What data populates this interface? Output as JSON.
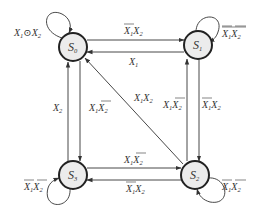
{
  "diagram": {
    "type": "state-transition",
    "states": [
      {
        "id": "S0",
        "name": "S",
        "sub": "0",
        "cx": 73,
        "cy": 47
      },
      {
        "id": "S1",
        "name": "S",
        "sub": "1",
        "cx": 198,
        "cy": 45
      },
      {
        "id": "S3",
        "name": "S",
        "sub": "3",
        "cx": 73,
        "cy": 175
      },
      {
        "id": "S2",
        "name": "S",
        "sub": "2",
        "cx": 195,
        "cy": 175
      }
    ],
    "transitions": [
      {
        "from": "S0",
        "to": "S0",
        "label": "X1⊙X2"
      },
      {
        "from": "S1",
        "to": "S1",
        "label": "X̄1X̄2"
      },
      {
        "from": "S3",
        "to": "S3",
        "label": "X̄1X̄2"
      },
      {
        "from": "S2",
        "to": "S2",
        "label": "X̄1X̄2"
      },
      {
        "from": "S0",
        "to": "S1",
        "label": "X̄1X2"
      },
      {
        "from": "S1",
        "to": "S0",
        "label": "X1"
      },
      {
        "from": "S3",
        "to": "S0",
        "label": "X2"
      },
      {
        "from": "S0",
        "to": "S3",
        "label": "X1X̄2"
      },
      {
        "from": "S2",
        "to": "S1",
        "label": "X1X̄2"
      },
      {
        "from": "S1",
        "to": "S2",
        "label": "X̄1X2"
      },
      {
        "from": "S3",
        "to": "S2",
        "label": "X1X̄2"
      },
      {
        "from": "S2",
        "to": "S3",
        "label": "X̄1X2"
      },
      {
        "from": "S2",
        "to": "S0",
        "label": "X1X2"
      }
    ]
  },
  "labels": {
    "s0": "S",
    "s0_sub": "0",
    "s1": "S",
    "s1_sub": "1",
    "s2": "S",
    "s2_sub": "2",
    "s3": "S",
    "s3_sub": "3",
    "x": "X",
    "one": "1",
    "two": "2",
    "xnor": "⊙"
  }
}
